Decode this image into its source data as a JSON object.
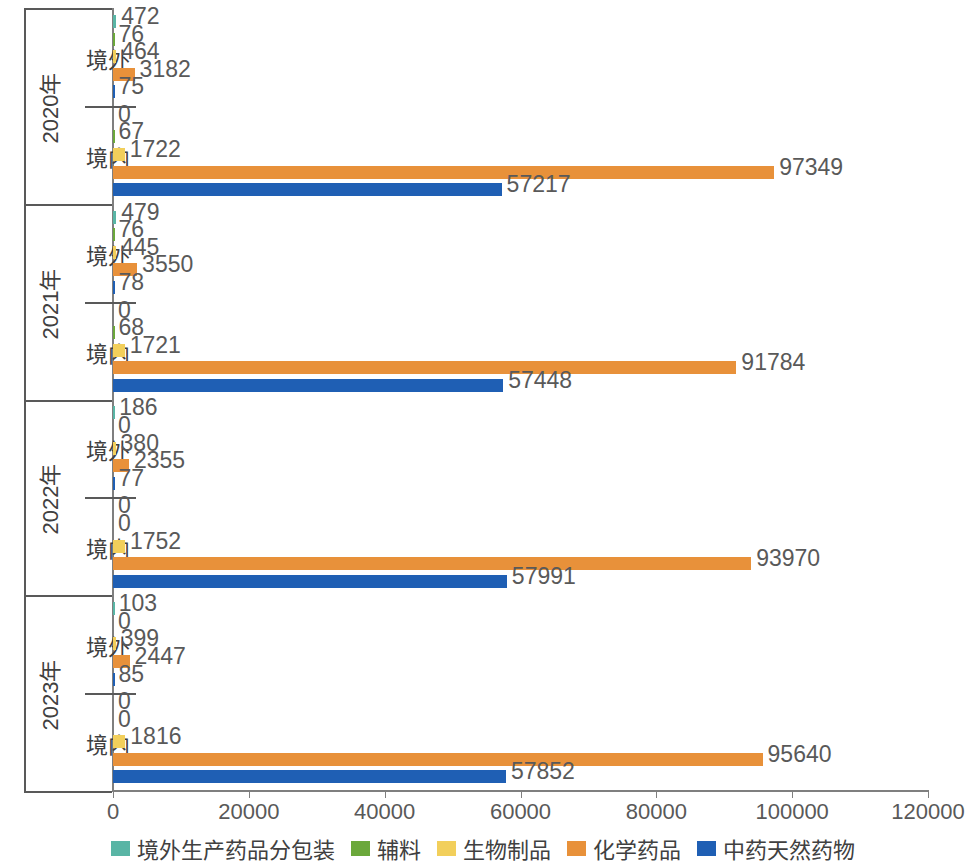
{
  "chart_data": {
    "type": "bar",
    "orientation": "horizontal",
    "title": "",
    "xlabel": "",
    "ylabel": "",
    "xlim": [
      0,
      120000
    ],
    "xticks": [
      0,
      20000,
      40000,
      60000,
      80000,
      100000,
      120000
    ],
    "xtick_labels": [
      "0",
      "20000",
      "40000",
      "60000",
      "80000",
      "100000",
      "120000"
    ],
    "grid": false,
    "legend_position": "bottom",
    "series": [
      {
        "name": "境外生产药品分包装",
        "color": "#59b5a5"
      },
      {
        "name": "辅料",
        "color": "#6ba83b"
      },
      {
        "name": "生物制品",
        "color": "#f2cf5b"
      },
      {
        "name": "化学药品",
        "color": "#e8913a"
      },
      {
        "name": "中药天然药物",
        "color": "#1f5fb4"
      }
    ],
    "groups": [
      {
        "year": "2020年",
        "subgroups": [
          {
            "name": "境外",
            "values": [
              472,
              76,
              464,
              3182,
              75
            ]
          },
          {
            "name": "境内",
            "values": [
              0,
              67,
              1722,
              97349,
              57217
            ]
          }
        ]
      },
      {
        "year": "2021年",
        "subgroups": [
          {
            "name": "境外",
            "values": [
              479,
              76,
              445,
              3550,
              78
            ]
          },
          {
            "name": "境内",
            "values": [
              0,
              68,
              1721,
              91784,
              57448
            ]
          }
        ]
      },
      {
        "year": "2022年",
        "subgroups": [
          {
            "name": "境外",
            "values": [
              186,
              0,
              380,
              2355,
              77
            ]
          },
          {
            "name": "境内",
            "values": [
              0,
              0,
              1752,
              93970,
              57991
            ]
          }
        ]
      },
      {
        "year": "2023年",
        "subgroups": [
          {
            "name": "境外",
            "values": [
              103,
              0,
              399,
              2447,
              85
            ]
          },
          {
            "name": "境内",
            "values": [
              0,
              0,
              1816,
              95640,
              57852
            ]
          }
        ]
      }
    ]
  }
}
